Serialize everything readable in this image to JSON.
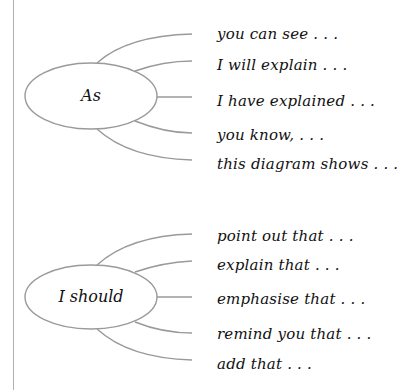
{
  "diagrams": [
    {
      "hub": "As",
      "branches": [
        "you can see . . .",
        "I will explain . . .",
        "I have explained . . .",
        "you know, . . .",
        "this diagram shows . . ."
      ]
    },
    {
      "hub": "I should",
      "branches": [
        "point out that . . .",
        "explain that . . .",
        "emphasise that . . .",
        "remind you that . . .",
        "add that . . ."
      ]
    }
  ],
  "colors": {
    "line": "#9a9a9a",
    "text": "#111111",
    "background": "#ffffff"
  }
}
